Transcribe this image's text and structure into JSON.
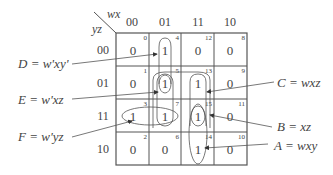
{
  "axes": {
    "column_var": "wx",
    "row_var": "yz",
    "columns": [
      "00",
      "01",
      "11",
      "10"
    ],
    "rows": [
      "00",
      "01",
      "11",
      "10"
    ]
  },
  "cells": [
    [
      {
        "value": "0",
        "index": "0"
      },
      {
        "value": "1",
        "index": "4"
      },
      {
        "value": "0",
        "index": "12"
      },
      {
        "value": "0",
        "index": "8"
      }
    ],
    [
      {
        "value": "0",
        "index": "1"
      },
      {
        "value": "1",
        "index": "5"
      },
      {
        "value": "1",
        "index": "13"
      },
      {
        "value": "0",
        "index": "9"
      }
    ],
    [
      {
        "value": "1",
        "index": "3"
      },
      {
        "value": "1",
        "index": "7"
      },
      {
        "value": "1",
        "index": "15"
      },
      {
        "value": "0",
        "index": "11"
      }
    ],
    [
      {
        "value": "0",
        "index": "2"
      },
      {
        "value": "0",
        "index": "6"
      },
      {
        "value": "1",
        "index": "14"
      },
      {
        "value": "0",
        "index": "10"
      }
    ]
  ],
  "terms": {
    "D": "D = w'xy'",
    "E": "E = w'xz",
    "F": "F = w'yz",
    "C": "C = wxz",
    "B": "B = xz",
    "A": "A = wxy"
  },
  "colors": {
    "line": "#555555",
    "text": "#444444"
  }
}
